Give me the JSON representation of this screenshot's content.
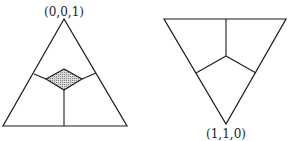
{
  "diagrams": [
    {
      "name": "upright-triangle",
      "vertex_label": "(0,0,1)",
      "shaded_region": "diamond"
    },
    {
      "name": "inverted-triangle",
      "vertex_label": "(1,1,0)"
    }
  ],
  "colors": {
    "stroke": "#1a1a1a",
    "shade": "#b8b8b8",
    "background": "#ffffff"
  }
}
